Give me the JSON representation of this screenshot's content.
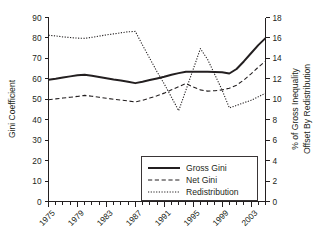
{
  "chart_data": {
    "type": "line",
    "title": "",
    "xlabel": "",
    "ylabel": "Gini Coefficient",
    "y2label": "% of Gross Inequality Offset By Redistribution",
    "y2label_line1": "% of Gross Inequality",
    "y2label_line2": "Offset By Redistribution",
    "grid": false,
    "legend_position": "lower-right-inside",
    "xlim": [
      1975,
      2005
    ],
    "ylim": [
      0,
      90
    ],
    "y2lim": [
      0,
      18
    ],
    "yticks": [
      0,
      10,
      20,
      30,
      40,
      50,
      60,
      70,
      80,
      90
    ],
    "ytick_labels": [
      "0",
      "10",
      "20",
      "30",
      "40",
      "50",
      "60",
      "70",
      "80",
      "90"
    ],
    "y2ticks": [
      0,
      2,
      4,
      6,
      8,
      10,
      12,
      14,
      16,
      18
    ],
    "y2tick_labels": [
      "0",
      "2",
      "4",
      "6",
      "8",
      "10",
      "12",
      "14",
      "16",
      "18"
    ],
    "xticks": [
      1975,
      1979,
      1983,
      1987,
      1991,
      1995,
      1999,
      2003
    ],
    "xtick_labels": [
      "1975",
      "1979",
      "1983",
      "1987",
      "1991",
      "1995",
      "1999",
      "2003"
    ],
    "xtick_minor_step": 1,
    "x": [
      1975,
      1976,
      1977,
      1978,
      1979,
      1980,
      1981,
      1982,
      1983,
      1984,
      1985,
      1986,
      1987,
      1988,
      1989,
      1990,
      1991,
      1992,
      1993,
      1994,
      1995,
      1996,
      1997,
      1998,
      1999,
      2000,
      2001,
      2002,
      2003,
      2004,
      2005
    ],
    "series": [
      {
        "name": "Gross Gini",
        "axis": "left",
        "style": "solid",
        "values": [
          59.5,
          60.0,
          60.6,
          61.2,
          61.7,
          62.0,
          61.5,
          60.9,
          60.3,
          59.7,
          59.2,
          58.6,
          57.9,
          58.6,
          59.4,
          60.2,
          61.0,
          62.0,
          62.8,
          63.5,
          63.5,
          63.5,
          63.5,
          63.4,
          63.2,
          62.6,
          64.8,
          68.5,
          72.5,
          76.5,
          79.9
        ]
      },
      {
        "name": "Net Gini",
        "axis": "left",
        "style": "dashed",
        "values": [
          49.8,
          50.2,
          50.6,
          51.0,
          51.4,
          51.9,
          51.5,
          51.0,
          50.5,
          50.0,
          49.6,
          49.2,
          48.7,
          49.5,
          50.6,
          51.7,
          53.0,
          54.6,
          56.2,
          57.7,
          56.0,
          54.6,
          54.0,
          54.2,
          54.6,
          55.4,
          56.9,
          59.4,
          62.4,
          65.7,
          68.7
        ]
      },
      {
        "name": "Redistribution",
        "axis": "right",
        "style": "dotted",
        "values_left_scale": [
          81.3,
          81.0,
          80.5,
          80.2,
          79.9,
          79.8,
          80.3,
          80.9,
          81.5,
          82.0,
          82.5,
          83.0,
          83.2,
          76.5,
          70.0,
          63.5,
          57.5,
          51.0,
          44.4,
          54.5,
          64.6,
          74.8,
          69.5,
          62.0,
          54.5,
          45.8,
          47.0,
          48.3,
          49.5,
          51.2,
          53.0
        ],
        "values": [
          16.26,
          16.2,
          16.1,
          16.04,
          15.98,
          15.96,
          16.06,
          16.18,
          16.3,
          16.4,
          16.5,
          16.6,
          16.64,
          15.3,
          14.0,
          12.7,
          11.5,
          10.2,
          8.88,
          10.9,
          12.92,
          14.96,
          13.9,
          12.4,
          10.9,
          9.16,
          9.4,
          9.66,
          9.9,
          10.24,
          10.6
        ]
      }
    ],
    "legend": [
      {
        "label": "Gross Gini",
        "style": "solid"
      },
      {
        "label": "Net Gini",
        "style": "dashed"
      },
      {
        "label": "Redistribution",
        "style": "dotted"
      }
    ]
  },
  "caption": ""
}
